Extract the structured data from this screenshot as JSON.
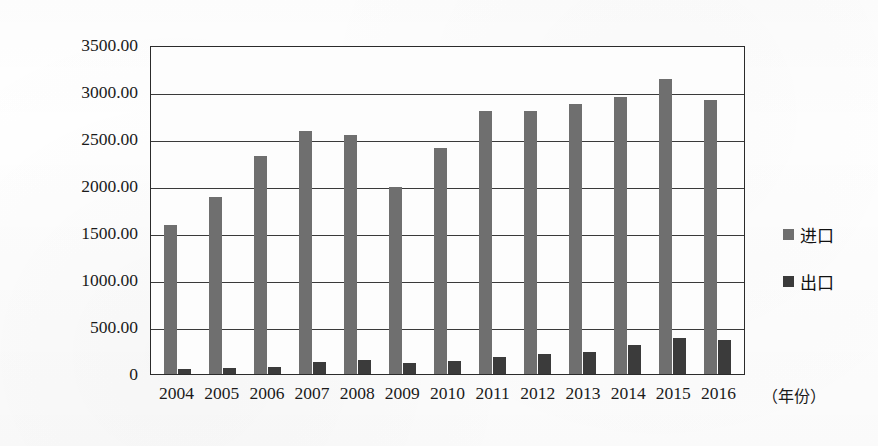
{
  "chart_data": {
    "type": "bar",
    "title": "",
    "xlabel": "（年份）",
    "ylabel": "",
    "categories": [
      "2004",
      "2005",
      "2006",
      "2007",
      "2008",
      "2009",
      "2010",
      "2011",
      "2012",
      "2013",
      "2014",
      "2015",
      "2016"
    ],
    "series": [
      {
        "name": "进口",
        "color": "#6f6f6f",
        "values": [
          1590,
          1880,
          2320,
          2590,
          2540,
          1990,
          2400,
          2800,
          2800,
          2870,
          2950,
          3140,
          2910
        ]
      },
      {
        "name": "出口",
        "color": "#3b3b3b",
        "values": [
          50,
          65,
          70,
          130,
          145,
          120,
          140,
          180,
          215,
          230,
          310,
          380,
          360
        ]
      }
    ],
    "ylim": [
      0,
      3500
    ],
    "yticks": [
      3500,
      3000,
      2500,
      2000,
      1500,
      1000,
      500,
      0
    ],
    "ytick_labels": [
      "3500.00",
      "3000.00",
      "2500.00",
      "2000.00",
      "1500.00",
      "1000.00",
      "500.00",
      "0"
    ],
    "grid": true,
    "legend_position": "right"
  },
  "legend": {
    "entries": [
      {
        "label": "进口"
      },
      {
        "label": "出口"
      }
    ]
  },
  "axis": {
    "x_title": "（年份）"
  },
  "colors": {
    "import": "#6f6f6f",
    "export": "#3b3b3b",
    "axis": "#2b2b2b",
    "grid": "#3a3a3a",
    "background": "#ffffff"
  }
}
